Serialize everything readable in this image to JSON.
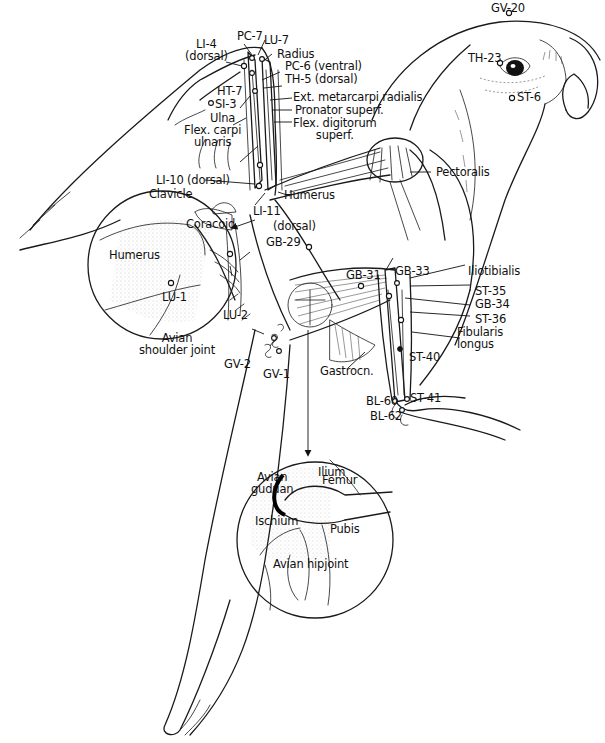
{
  "figure": {
    "colors": {
      "line": "#1a1a1a",
      "background": "#ffffff"
    }
  },
  "labels": {
    "pc7": "PC-7",
    "lu7": "LU-7",
    "li4": "LI-4\n(dorsal)",
    "radius": "Radius",
    "pc6": "PC-6 (ventral)",
    "th5": "TH-5 (dorsal)",
    "ext_metacarpi": "Ext. metarcarpi radialis",
    "pronator": "Pronator superf.",
    "flex_digitorum": "Flex. digitorum\nsuperf.",
    "ht7": "HT-7",
    "si3": "SI-3",
    "ulna": "Ulna",
    "flex_carpi": "Flex. carpi\nulnaris",
    "li10": "LI-10 (dorsal)",
    "li11": "LI-11",
    "humerus_wing": "Humerus",
    "dorsal": "(dorsal)",
    "gb29": "GB-29",
    "clavicle": "Clavicle",
    "coracoid": "Coracoid",
    "humerus_inset": "Humerus",
    "lu1": "LU-1",
    "lu2": "LU-2",
    "shoulder_caption": "Avian\nshoulder joint",
    "gv20": "GV-20",
    "th23": "TH-23",
    "st6": "ST-6",
    "pectoralis": "Pectoralis",
    "gb31": "GB-31",
    "gb33": "GB-33",
    "iliotibialis": "Iliotibialis",
    "st35": "ST-35",
    "gb34": "GB-34",
    "st36": "ST-36",
    "fibularis": "Fibularis\nlongus",
    "st40": "ST-40",
    "st41": "ST-41",
    "bl60": "BL-60",
    "bl62": "BL-62",
    "gastrocn": "Gastrocn.",
    "gv2": "GV-2",
    "gv1": "GV-1",
    "ilium": "Ilium",
    "avian_guduan": "Avian\nguduan",
    "femur": "Femur",
    "ischium": "Ischium",
    "pubis": "Pubis",
    "hip_caption": "Avian hipjoint"
  },
  "insets": [
    {
      "id": "shoulder",
      "caption": "Avian shoulder joint"
    },
    {
      "id": "hip",
      "caption": "Avian hipjoint"
    }
  ]
}
